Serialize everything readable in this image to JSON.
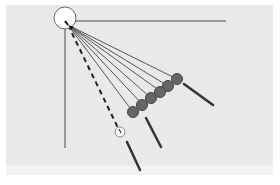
{
  "diagram": {
    "colors": {
      "background": "#e9e9e9",
      "axis_line": "#999999",
      "arm_line": "#555555",
      "ball_fill": "#666666",
      "ball_stroke": "#444444",
      "stick": "#333333",
      "hollow_ball_fill": "#ffffff",
      "pivot_circle_fill": "#ffffff",
      "pivot_circle_stroke": "#666666"
    },
    "pivot": {
      "cx": 67,
      "cy": 22,
      "r": 11
    },
    "axes": {
      "horizontal": {
        "x1": 75,
        "y1": 21,
        "x2": 226,
        "y2": 21
      },
      "vertical": {
        "x1": 65,
        "y1": 28,
        "x2": 65,
        "y2": 148
      }
    },
    "arms": [
      {
        "x2": 177,
        "y2": 79
      },
      {
        "x2": 168,
        "y2": 86
      },
      {
        "x2": 160,
        "y2": 91
      },
      {
        "x2": 151,
        "y2": 98
      },
      {
        "x2": 142,
        "y2": 104
      },
      {
        "x2": 133,
        "y2": 112
      }
    ],
    "dashed_arm": {
      "x2": 120,
      "y2": 132
    },
    "balls": [
      {
        "cx": 177,
        "cy": 79,
        "r": 5.5
      },
      {
        "cx": 168,
        "cy": 86,
        "r": 5.5
      },
      {
        "cx": 160,
        "cy": 92,
        "r": 5.5
      },
      {
        "cx": 151,
        "cy": 98,
        "r": 5.5
      },
      {
        "cx": 142,
        "cy": 105,
        "r": 5.5
      },
      {
        "cx": 133,
        "cy": 112,
        "r": 5.5
      }
    ],
    "hollow_ball": {
      "cx": 120,
      "cy": 132,
      "r": 5
    },
    "sticks": [
      {
        "x1": 184,
        "y1": 84,
        "x2": 213,
        "y2": 105
      },
      {
        "x1": 146,
        "y1": 118,
        "x2": 161,
        "y2": 147
      },
      {
        "x1": 127,
        "y1": 142,
        "x2": 140,
        "y2": 170
      }
    ]
  }
}
